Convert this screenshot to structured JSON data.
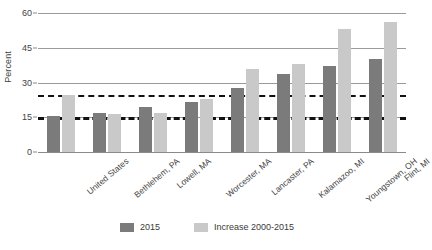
{
  "chart_data": {
    "type": "bar",
    "title": "",
    "subtitle": "",
    "xlabel": "",
    "ylabel": "Percent",
    "ylim": [
      0,
      60
    ],
    "yticks": [
      0,
      15,
      30,
      45,
      60
    ],
    "ytick_labels": [
      "0",
      "15",
      "30",
      "45",
      "60"
    ],
    "grid": true,
    "grid_axis": "y",
    "legend_position": "bottom",
    "categories": [
      "United States",
      "Bethlehem, PA",
      "Lowell, MA",
      "Worcester, MA",
      "Lancaster, PA",
      "Kalamazoo, MI",
      "Youngstown, OH",
      "Flint, MI"
    ],
    "series": [
      {
        "name": "2015",
        "color": "#7b7b7b",
        "values": [
          15.5,
          17.0,
          19.3,
          21.5,
          27.8,
          33.8,
          37.2,
          40.2
        ]
      },
      {
        "name": "Increase 2000-2015",
        "color": "#c9c9c9",
        "values": [
          24.5,
          16.5,
          17.0,
          23.0,
          35.8,
          38.0,
          53.0,
          56.0
        ]
      }
    ],
    "reference_lines": [
      {
        "name": "us-increase-reference",
        "value": 24.5,
        "style": "dashed",
        "color": "#111111"
      },
      {
        "name": "us-2015-reference",
        "value": 15.0,
        "style": "dashed",
        "color": "#111111"
      }
    ]
  },
  "legend": {
    "items": [
      {
        "label": "2015",
        "color": "#7b7b7b"
      },
      {
        "label": "Increase 2000-2015",
        "color": "#c9c9c9"
      }
    ]
  },
  "axis": {
    "y_title": "Percent"
  }
}
